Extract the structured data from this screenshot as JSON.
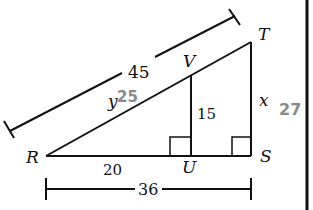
{
  "diagram": {
    "type": "similar-right-triangles",
    "points": {
      "R": "R",
      "S": "S",
      "T": "T",
      "U": "U",
      "V": "V"
    },
    "measures": {
      "RT": "45",
      "RV": "y",
      "VU": "15",
      "TS": "x",
      "RU": "20",
      "RS": "36"
    },
    "answers": {
      "y": "25",
      "x": "27"
    },
    "colors": {
      "line": "#111111",
      "answer": "#8a8a8a"
    }
  }
}
